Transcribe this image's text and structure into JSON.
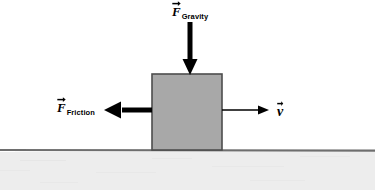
{
  "diagram": {
    "title_text": "",
    "background_color": "#ffffff",
    "block": {
      "name": "block",
      "fill_color": "#a8a8a8",
      "stroke_color": "#4d4d4d",
      "x": 152,
      "y": 74,
      "width": 70,
      "height": 76
    },
    "ground": {
      "name": "ground",
      "line_color": "#6e6e6e",
      "line_y": 150,
      "fill_color": "#ededed",
      "fill_top": 152
    },
    "vectors": [
      {
        "id": "gravity",
        "symbol": "F",
        "subscript": "Gravity",
        "direction": "down",
        "color": "#000000",
        "label_x": 172,
        "label_y": 3,
        "start_x": 190,
        "start_y": 22,
        "end_x": 190,
        "end_y": 75,
        "shaft_width": 5,
        "head_width": 15,
        "head_length": 16
      },
      {
        "id": "friction",
        "symbol": "F",
        "subscript": "Friction",
        "direction": "left",
        "color": "#000000",
        "label_x": 57,
        "label_y": 99,
        "start_x": 152,
        "start_y": 110,
        "end_x": 104,
        "end_y": 110,
        "shaft_width": 5,
        "head_width": 17,
        "head_length": 17
      },
      {
        "id": "velocity",
        "symbol": "v",
        "subscript": "",
        "direction": "right",
        "color": "#000000",
        "label_x": 277,
        "label_y": 103,
        "start_x": 222,
        "start_y": 110,
        "end_x": 269,
        "end_y": 110,
        "shaft_width": 1.6,
        "head_width": 9,
        "head_length": 11
      }
    ]
  }
}
